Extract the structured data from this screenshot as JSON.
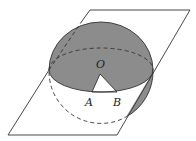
{
  "diagram": {
    "type": "geometry",
    "colors": {
      "stroke": "#333333",
      "shade": "#8c8c8c",
      "background": "#ffffff"
    },
    "labels": {
      "center": "O",
      "point_a": "A",
      "point_b": "B"
    }
  }
}
